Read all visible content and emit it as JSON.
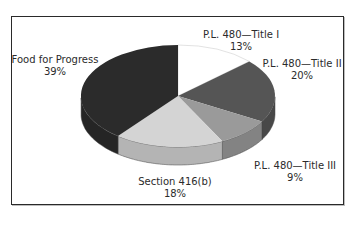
{
  "chart_data": {
    "type": "pie",
    "style": "3d",
    "title": "",
    "categories": [
      "P.L. 480—Title I",
      "P.L. 480—Title II",
      "P.L. 480—Title III",
      "Section 416(b)",
      "Food for Progress"
    ],
    "values": [
      13,
      20,
      9,
      18,
      39
    ],
    "unit": "%",
    "start_angle_deg": 90,
    "direction": "clockwise",
    "legend": "none (direct labels)",
    "colors": [
      "#ffffff",
      "#555555",
      "#9a9a9a",
      "#d4d4d4",
      "#2b2b2b"
    ]
  },
  "labels": [
    {
      "name": "P.L. 480—Title I",
      "pct": "13%"
    },
    {
      "name": "P.L. 480—Title II",
      "pct": "20%"
    },
    {
      "name": "P.L. 480—Title III",
      "pct": "9%"
    },
    {
      "name": "Section 416(b)",
      "pct": "18%"
    },
    {
      "name": "Food for Progress",
      "pct": "39%"
    }
  ]
}
